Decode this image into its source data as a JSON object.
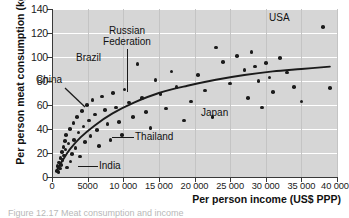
{
  "chart_data": {
    "type": "scatter",
    "title": "",
    "xlabel": "Per person income (US$ PPP)",
    "ylabel": "Per person meat consumption (kg)",
    "xlim": [
      0,
      40000
    ],
    "ylim": [
      0,
      140
    ],
    "xticks": [
      0,
      5000,
      10000,
      15000,
      20000,
      25000,
      30000,
      35000,
      40000
    ],
    "xtick_labels": [
      "0",
      "5000",
      "10 000",
      "15 000",
      "20 000",
      "25 000",
      "30 000",
      "35 000",
      "40 000"
    ],
    "yticks": [
      0,
      20,
      40,
      60,
      80,
      100,
      120,
      140
    ],
    "ytick_labels": [
      "0",
      "20",
      "40",
      "60",
      "80",
      "100",
      "120",
      "140"
    ],
    "grid": "horizontal-white-and-vertical-grey",
    "legend": "none",
    "plot_background": "#d6d6d6",
    "point_color": "#1b1b1b",
    "trend_color": "#1b1b1b",
    "points": [
      [
        700,
        5
      ],
      [
        800,
        9
      ],
      [
        900,
        4
      ],
      [
        1000,
        12
      ],
      [
        1100,
        7
      ],
      [
        1200,
        16
      ],
      [
        1300,
        10
      ],
      [
        1400,
        21
      ],
      [
        1500,
        14
      ],
      [
        1600,
        25
      ],
      [
        1700,
        18
      ],
      [
        1800,
        30
      ],
      [
        1900,
        23
      ],
      [
        2000,
        35
      ],
      [
        2100,
        8
      ],
      [
        2300,
        28
      ],
      [
        2500,
        40
      ],
      [
        2600,
        13
      ],
      [
        2800,
        19
      ],
      [
        3000,
        45
      ],
      [
        3100,
        31
      ],
      [
        3300,
        24
      ],
      [
        3500,
        50
      ],
      [
        3700,
        37
      ],
      [
        3900,
        17
      ],
      [
        4200,
        55
      ],
      [
        4400,
        42
      ],
      [
        4600,
        29
      ],
      [
        4900,
        60
      ],
      [
        5200,
        47
      ],
      [
        5400,
        34
      ],
      [
        5700,
        64
      ],
      [
        6000,
        52
      ],
      [
        6300,
        39
      ],
      [
        6600,
        26
      ],
      [
        7000,
        67
      ],
      [
        7400,
        56
      ],
      [
        7800,
        44
      ],
      [
        8200,
        31
      ],
      [
        8600,
        70
      ],
      [
        9000,
        58
      ],
      [
        9400,
        46
      ],
      [
        9800,
        35
      ],
      [
        10200,
        73
      ],
      [
        10800,
        62
      ],
      [
        11400,
        50
      ],
      [
        12000,
        94
      ],
      [
        12600,
        66
      ],
      [
        13200,
        54
      ],
      [
        13800,
        41
      ],
      [
        14500,
        81
      ],
      [
        15200,
        69
      ],
      [
        16000,
        57
      ],
      [
        16800,
        88
      ],
      [
        17500,
        75
      ],
      [
        18500,
        47
      ],
      [
        19500,
        63
      ],
      [
        20500,
        85
      ],
      [
        21500,
        72
      ],
      [
        22500,
        50
      ],
      [
        23000,
        108
      ],
      [
        24000,
        96
      ],
      [
        25000,
        78
      ],
      [
        26000,
        101
      ],
      [
        27000,
        89
      ],
      [
        27500,
        66
      ],
      [
        28000,
        104
      ],
      [
        28500,
        92
      ],
      [
        29000,
        80
      ],
      [
        29500,
        58
      ],
      [
        30000,
        95
      ],
      [
        30500,
        83
      ],
      [
        31000,
        71
      ],
      [
        32000,
        99
      ],
      [
        33000,
        87
      ],
      [
        34000,
        75
      ],
      [
        35000,
        63
      ],
      [
        38000,
        125
      ],
      [
        39000,
        74
      ]
    ],
    "trend_curve": [
      [
        600,
        5
      ],
      [
        1500,
        14
      ],
      [
        2500,
        23
      ],
      [
        4000,
        33
      ],
      [
        6000,
        43
      ],
      [
        8500,
        53
      ],
      [
        11500,
        62
      ],
      [
        15000,
        70
      ],
      [
        19000,
        76
      ],
      [
        23000,
        81
      ],
      [
        27000,
        85
      ],
      [
        31000,
        88
      ],
      [
        35000,
        90
      ],
      [
        39000,
        92
      ]
    ],
    "annotations": [
      {
        "label": "USA",
        "value_x": 38000,
        "value_y": 125
      },
      {
        "label": "Japan",
        "value_x": 27500,
        "value_y": 66
      },
      {
        "label": "Russian Federation",
        "value_x": 16800,
        "value_y": 88
      },
      {
        "label": "Brazil",
        "value_x": 12000,
        "value_y": 94
      },
      {
        "label": "China",
        "value_x": 6600,
        "value_y": 26
      },
      {
        "label": "Thailand",
        "value_x": 9400,
        "value_y": 46
      },
      {
        "label": "India",
        "value_x": 3300,
        "value_y": 24
      }
    ]
  },
  "figure": {
    "caption": "Figure 12.17 Meat consumption and income"
  }
}
